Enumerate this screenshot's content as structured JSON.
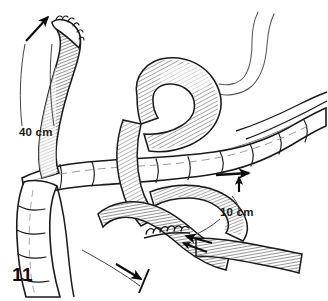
{
  "figure": {
    "number": "11",
    "type": "surgical-line-art-illustration",
    "background_color": "#ffffff",
    "ink_color": "#1a1a1a"
  },
  "labels": {
    "proximal_limb_length": "40 cm",
    "distal_limb_length": "10 cm"
  },
  "annotations": {
    "arrow_upper_left": "direction-arrow-proximal-limb",
    "arrow_right": "direction-arrow-colon-segment",
    "arrow_anastomosis": "pointer-arrow-anastomosis",
    "arrow_lower": "direction-arrow-efferent-limb"
  },
  "structures": [
    {
      "id": "proximal-jejunal-limb",
      "label": "Proximal jejunal limb with closed stapled end"
    },
    {
      "id": "bowel-hairpin-loop",
      "label": "Hairpin loop of small bowel"
    },
    {
      "id": "transverse-colon",
      "label": "Transverse colon with haustra"
    },
    {
      "id": "descending-colon",
      "label": "Descending colon"
    },
    {
      "id": "efferent-limb",
      "label": "Efferent small bowel limb"
    },
    {
      "id": "anastomosis",
      "label": "Sutured enteroenterostomy anastomosis"
    },
    {
      "id": "free-bowel-end",
      "label": "Unshaded bowel continuation superior"
    }
  ]
}
